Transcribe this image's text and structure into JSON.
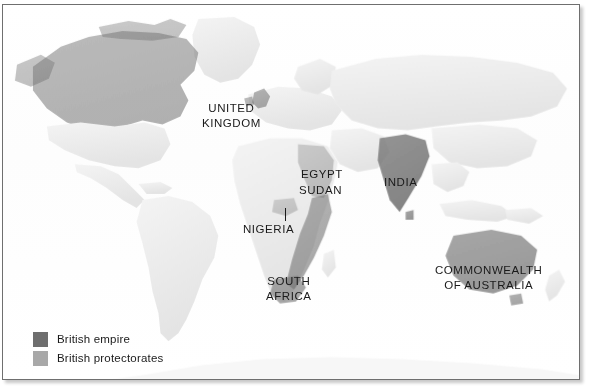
{
  "figure": {
    "kind": "historical-reference-map",
    "background_color": "#ffffff",
    "frame_border_color": "#6f6f6f"
  },
  "colors": {
    "empire": "#6e6e6e",
    "protectorate": "#a8a8a8",
    "land_base": "#e2e2e2",
    "land_light": "#f0f0f0",
    "label_text": "#1a1a1a",
    "frame": "#6f6f6f"
  },
  "labels": [
    {
      "id": "united-kingdom",
      "text": "UNITED\nKINGDOM",
      "x": 199,
      "y": 96
    },
    {
      "id": "egypt",
      "text": "EGYPT",
      "x": 298,
      "y": 162
    },
    {
      "id": "sudan",
      "text": "SUDAN",
      "x": 296,
      "y": 178
    },
    {
      "id": "india",
      "text": "INDIA",
      "x": 381,
      "y": 170
    },
    {
      "id": "nigeria",
      "text": "NIGERIA",
      "x": 240,
      "y": 217
    },
    {
      "id": "south-africa",
      "text": "SOUTH\nAFRICA",
      "x": 263,
      "y": 269
    },
    {
      "id": "commonwealth-of-australia",
      "text": "COMMONWEALTH\nOF AUSTRALIA",
      "x": 432,
      "y": 258
    }
  ],
  "leader_lines": [
    {
      "id": "nigeria-leader",
      "x": 282,
      "y": 203,
      "height": 13
    }
  ],
  "legend": {
    "items": [
      {
        "id": "british-empire",
        "label": "British empire",
        "color": "#6e6e6e"
      },
      {
        "id": "british-protectorates",
        "label": "British protectorates",
        "color": "#a8a8a8"
      }
    ]
  }
}
